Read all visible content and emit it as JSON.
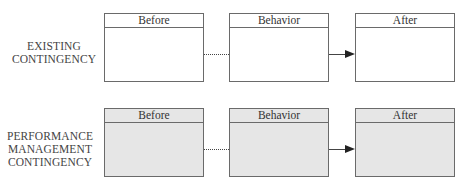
{
  "rows": [
    {
      "label_lines": [
        "EXISTING",
        "CONTINGENCY"
      ],
      "shaded": false,
      "boxes": [
        {
          "title": "Before"
        },
        {
          "title": "Behavior"
        },
        {
          "title": "After"
        }
      ],
      "connectors": [
        {
          "from": "Before",
          "to": "Behavior",
          "style": "dotted"
        },
        {
          "from": "Behavior",
          "to": "After",
          "style": "arrow"
        }
      ]
    },
    {
      "label_lines": [
        "PERFORMANCE",
        "MANAGEMENT",
        "CONTINGENCY"
      ],
      "shaded": true,
      "boxes": [
        {
          "title": "Before"
        },
        {
          "title": "Behavior"
        },
        {
          "title": "After"
        }
      ],
      "connectors": [
        {
          "from": "Before",
          "to": "Behavior",
          "style": "dotted"
        },
        {
          "from": "Behavior",
          "to": "After",
          "style": "arrow"
        }
      ]
    }
  ],
  "colors": {
    "border": "#6a6a6a",
    "shaded_fill": "#e6e6e6",
    "unshaded_fill": "#ffffff",
    "arrow": "#222222"
  }
}
